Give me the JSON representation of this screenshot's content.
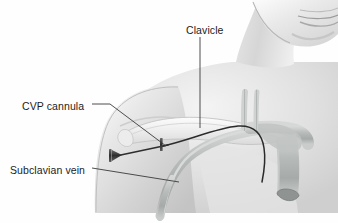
{
  "figure": {
    "type": "medical-illustration",
    "view": "anterior upper chest, shoulder and neck",
    "background_color": "#fefefe",
    "line_color": "#3a3a3a",
    "text_color": "#1c1c1c",
    "skin_tone": "#d9d9d9",
    "vessel_tone": "#b9bcbb",
    "catheter_color": "#2b2b2b",
    "width": 338,
    "height": 223
  },
  "labels": {
    "clavicle": "Clavicle",
    "cvp_cannula": "CVP cannula",
    "subclavian_vein": "Subclavian vein"
  },
  "leader_lines": [
    {
      "name": "clavicle-leader",
      "from": [
        200,
        37
      ],
      "to": [
        200,
        128
      ],
      "shape": "vertical"
    },
    {
      "name": "cvp-cannula-leader",
      "from": [
        92,
        104
      ],
      "to": [
        163,
        146
      ],
      "shape": "elbow-diagonal"
    },
    {
      "name": "subclavian-vein-leader",
      "from": [
        92,
        168
      ],
      "to": [
        178,
        181
      ],
      "shape": "shallow-diagonal"
    }
  ],
  "anatomy": [
    {
      "name": "head-and-chin",
      "description": "lower face with lips and chin, upper right"
    },
    {
      "name": "neck",
      "description": "neck column descending from jaw to chest"
    },
    {
      "name": "shoulder-and-arm",
      "description": "left shoulder and upper arm, lower left"
    },
    {
      "name": "chest-wall",
      "description": "upper chest between neck and shoulder"
    },
    {
      "name": "clavicle-bone",
      "description": "collarbone ridge arcing across the upper chest"
    },
    {
      "name": "subclavian-vein",
      "description": "vein running beneath the clavicle toward the arm"
    },
    {
      "name": "jugular-veins",
      "description": "two vertical vessels rising into the neck"
    },
    {
      "name": "superior-vena-cava",
      "description": "large vessel descending toward the heart"
    },
    {
      "name": "cvp-cannula-needle",
      "description": "needle and hub entering below the clavicle"
    },
    {
      "name": "catheter-line",
      "description": "dark catheter threaded from the cannula into the vena cava"
    }
  ]
}
